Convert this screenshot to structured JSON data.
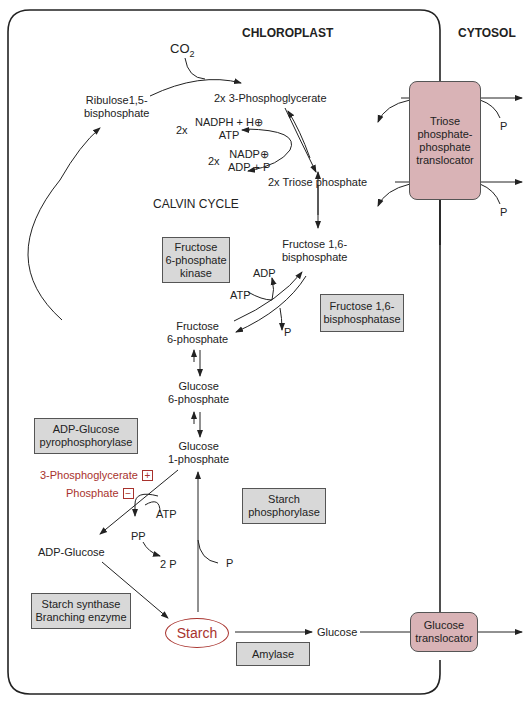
{
  "headers": {
    "chloroplast": "CHLOROPLAST",
    "cytosol": "CYTOSOL"
  },
  "metabolites": {
    "co2": "CO",
    "co2_sub": "2",
    "rubp_line1": "Ribulose1,5-",
    "rubp_line2": "bisphosphate",
    "pga": "2x  3-Phosphoglycerate",
    "nadph_prefix": "2x",
    "nadph_line1": "NADPH + H⊕",
    "nadph_line2": "ATP",
    "nadp_prefix": "2x",
    "nadp_line1": "NADP⊕",
    "nadp_line2": "ADP + P",
    "triose": "2x  Triose phosphate",
    "calvin": "CALVIN CYCLE",
    "fbp_line1": "Fructose 1,6-",
    "fbp_line2": "bisphosphate",
    "adp": "ADP",
    "atp": "ATP",
    "p_fbpase": "P",
    "f6p_line1": "Fructose",
    "f6p_line2": "6-phosphate",
    "g6p_line1": "Glucose",
    "g6p_line2": "6-phosphate",
    "g1p_line1": "Glucose",
    "g1p_line2": "1-phosphate",
    "activator": "3-Phosphoglycerate",
    "activator_sign": "+",
    "inhibitor": "Phosphate",
    "inhibitor_sign": "−",
    "atp_agpase": "ATP",
    "pp": "PP",
    "two_p": "2 P",
    "adp_glucose": "ADP-Glucose",
    "p_phosphorylase": "P",
    "starch": "Starch",
    "glucose": "Glucose",
    "p_tpt1": "P",
    "p_tpt2": "P"
  },
  "enzymes": {
    "pfk": [
      "Fructose",
      "6-phosphate",
      "kinase"
    ],
    "fbpase": [
      "Fructose 1,6-",
      "bisphosphatase"
    ],
    "agpase": [
      "ADP-Glucose",
      "pyrophosphorylase"
    ],
    "phosphorylase": [
      "Starch",
      "phosphorylase"
    ],
    "synthase": [
      "Starch synthase",
      "Branching enzyme"
    ],
    "amylase": [
      "Amylase"
    ]
  },
  "translocators": {
    "tpt": [
      "Triose",
      "phosphate-",
      "phosphate",
      "translocator"
    ],
    "glucose": [
      "Glucose",
      "translocator"
    ]
  },
  "colors": {
    "regulator_red": "#a8322d",
    "enzyme_fill": "#d8d8d8",
    "translocator_fill": "#d9b3b6"
  }
}
